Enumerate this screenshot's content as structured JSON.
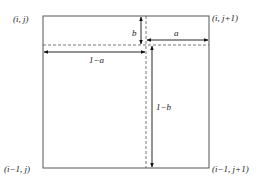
{
  "diagram": {
    "type": "bilinear-interpolation-cell",
    "corners": {
      "top_left": "(i, j)",
      "top_right": "(i, j+1)",
      "bottom_left": "(i−1, j)",
      "bottom_right": "(i−1, j+1)"
    },
    "labels": {
      "b": "b",
      "a": "a",
      "one_minus_a": "1−a",
      "one_minus_b": "1−b"
    },
    "colors": {
      "line": "#555555",
      "arrow": "#111111",
      "text": "#222222"
    }
  }
}
